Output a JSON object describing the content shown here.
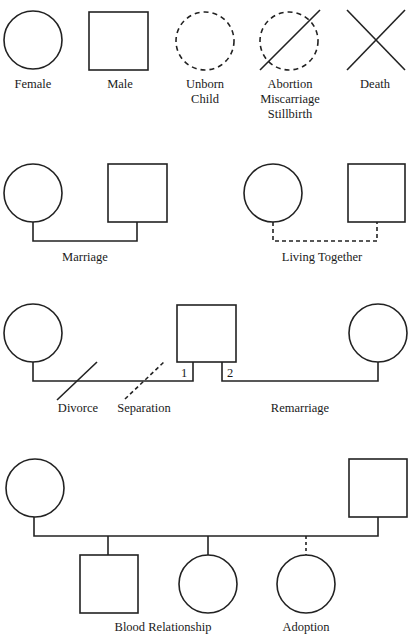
{
  "sections": {
    "individuals": {
      "female": {
        "label": "Female"
      },
      "male": {
        "label": "Male"
      },
      "unborn": {
        "lines": [
          "Unborn",
          "Child"
        ]
      },
      "abortion": {
        "lines": [
          "Abortion",
          "Miscarriage",
          "Stillbirth"
        ]
      },
      "death": {
        "label": "Death"
      }
    },
    "couples": {
      "marriage": {
        "label": "Marriage"
      },
      "living_together": {
        "label": "Living Together"
      }
    },
    "marital_changes": {
      "divorce": {
        "label": "Divorce"
      },
      "separation": {
        "label": "Separation"
      },
      "remarriage": {
        "label": "Remarriage"
      },
      "first_marriage_number": "1",
      "second_marriage_number": "2"
    },
    "children": {
      "blood_relationship": {
        "label": "Blood Relationship"
      },
      "adoption": {
        "label": "Adoption"
      }
    }
  },
  "colors": {
    "stroke": "#222222",
    "background": "#ffffff"
  }
}
